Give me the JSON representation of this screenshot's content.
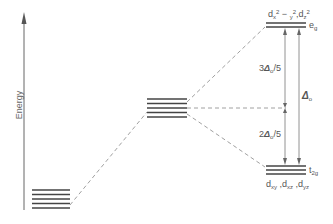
{
  "diagram": {
    "axis_label": "Energy",
    "levels": {
      "free_ion": {
        "lines": 5,
        "description": "five degenerate d orbitals (free ion)"
      },
      "spherical_field": {
        "lines": 5,
        "description": "five degenerate d orbitals (spherical field, raised)"
      },
      "eg": {
        "lines": 2,
        "label": "e_g",
        "orbitals": "d_{x²−y²}, d_{z²}"
      },
      "t2g": {
        "lines": 3,
        "label": "t_2g",
        "orbitals": "d_xy, d_xz, d_yz"
      }
    },
    "labels": {
      "eg": "e",
      "eg_sub": "g",
      "t2g": "t",
      "t2g_sub": "2g",
      "eg_orbitals_a": "d",
      "eg_orbitals_a_sub": "x",
      "eg_orbitals_a_sup1": "2",
      "eg_orbitals_a_mid": " − ",
      "eg_orbitals_a_sub2": "y",
      "eg_orbitals_a_sup2": "2",
      "eg_orbitals_sep": ",",
      "eg_orbitals_b": "d",
      "eg_orbitals_b_sub": "z",
      "eg_orbitals_b_sup": "2",
      "t2g_orbitals_1": "d",
      "t2g_orbitals_1_sub": "xy",
      "t2g_orbitals_2": "d",
      "t2g_orbitals_2_sub": "xz",
      "t2g_orbitals_3": "d",
      "t2g_orbitals_3_sub": "yz",
      "sep": " ,",
      "upper_split_coef": "3",
      "upper_split_delta": "Δ",
      "upper_split_sub": "o",
      "upper_split_den": "/5",
      "lower_split_coef": "2",
      "lower_split_delta": "Δ",
      "lower_split_sub": "o",
      "lower_split_den": "/5",
      "total_split_delta": "Δ",
      "total_split_sub": "o"
    },
    "colors": {
      "line": "#444444",
      "dashed": "#888888",
      "text": "#555555"
    }
  }
}
